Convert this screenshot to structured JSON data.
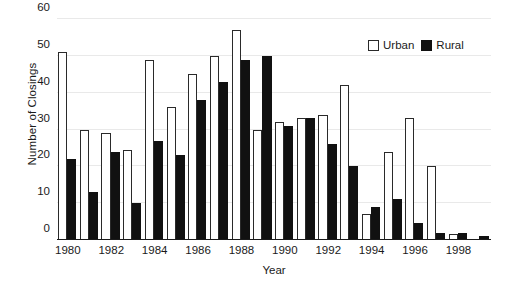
{
  "chart_data": {
    "type": "bar",
    "title": "",
    "xlabel": "Year",
    "ylabel": "Number of Closings",
    "categories": [
      "1980",
      "1981",
      "1982",
      "1983",
      "1984",
      "1985",
      "1986",
      "1987",
      "1988",
      "1989",
      "1990",
      "1991",
      "1992",
      "1993",
      "1994",
      "1995",
      "1996",
      "1997",
      "1998",
      "1999"
    ],
    "xtick_labels": [
      "1980",
      "1982",
      "1984",
      "1986",
      "1988",
      "1990",
      "1992",
      "1994",
      "1996",
      "1998"
    ],
    "ytick_labels": [
      "0",
      "10",
      "20",
      "30",
      "40",
      "50",
      "60"
    ],
    "yticks": [
      0,
      10,
      20,
      30,
      40,
      50,
      60
    ],
    "ylim": [
      0,
      60
    ],
    "grid": true,
    "grid_axis": "y",
    "legend_position": "top-right",
    "series": [
      {
        "name": "Urban",
        "color": "#ffffff",
        "edgecolor": "#2a2a2a",
        "values": [
          51,
          30,
          29,
          24.5,
          49,
          36,
          45,
          50,
          57,
          30,
          32,
          33,
          34,
          42,
          7,
          24,
          33,
          20,
          1.5,
          0
        ]
      },
      {
        "name": "Rural",
        "color": "#111111",
        "edgecolor": "#111111",
        "values": [
          22,
          13,
          24,
          10,
          27,
          23,
          38,
          43,
          49,
          50,
          31,
          33,
          26,
          20,
          9,
          11,
          4.5,
          2,
          2,
          1
        ]
      }
    ]
  },
  "legend": {
    "urban_label": "Urban",
    "rural_label": "Rural"
  },
  "axes": {
    "x_title": "Year",
    "y_title": "Number of Closings"
  }
}
